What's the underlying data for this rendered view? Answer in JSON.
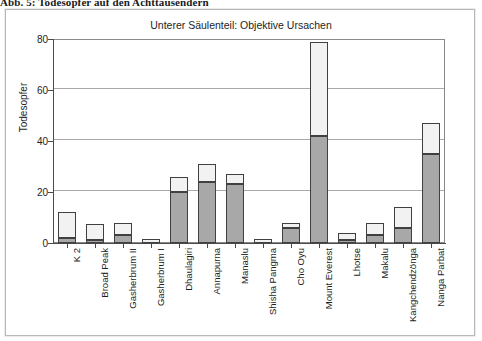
{
  "caption": "Abb. 5:  Todesopfer auf den Achttausendern",
  "chart": {
    "title": "Unterer Säulenteil: Objektive Ursachen",
    "y_axis_label": "Todesopfer"
  },
  "chart_data": {
    "type": "bar",
    "title": "Unterer Säulenteil: Objektive Ursachen",
    "xlabel": "",
    "ylabel": "Todesopfer",
    "ylim": [
      0,
      80
    ],
    "yticks": [
      0,
      20,
      40,
      60,
      80
    ],
    "grid": true,
    "legend": "none",
    "stacked": true,
    "categories": [
      "K 2",
      "Broad Peak",
      "Gasherbrum II",
      "Gasherbrum I",
      "Dhaulagiri",
      "Annapurna",
      "Manaslu",
      "Shisha Pangma",
      "Cho Oyu",
      "Mount Everest",
      "Lhotse",
      "Makalu",
      "Kangchendzönga",
      "Nanga Parbat"
    ],
    "series": [
      {
        "name": "Objektive Ursachen (unterer Säulenteil)",
        "color": "#a8a8a8",
        "values": [
          2,
          1,
          3,
          0,
          20,
          24,
          23,
          0,
          6,
          42,
          1,
          3,
          6,
          35
        ]
      },
      {
        "name": "Übrige Ursachen (oberer Säulenteil)",
        "color": "#f2f2f2",
        "values": [
          10,
          6.5,
          5,
          1.5,
          6,
          7,
          4,
          1.5,
          2,
          37,
          3,
          5,
          8,
          12
        ]
      }
    ],
    "totals": [
      12,
      7.5,
      8,
      1.5,
      26,
      31,
      27,
      1.5,
      8,
      79,
      4,
      8,
      14,
      47
    ]
  }
}
